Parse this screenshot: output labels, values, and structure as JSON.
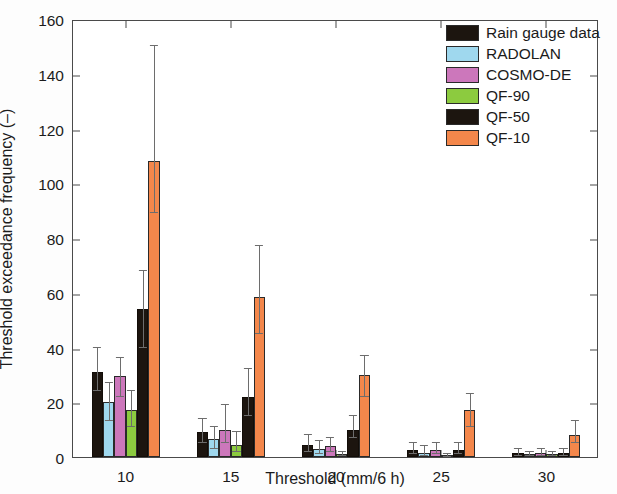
{
  "chart_data": {
    "type": "bar",
    "title": "",
    "xlabel": "Threshold (mm/6 h)",
    "ylabel": "Threshold exceedance frequency (–)",
    "categories": [
      "10",
      "15",
      "20",
      "25",
      "30"
    ],
    "xlim": [
      7.5,
      32.5
    ],
    "ylim": [
      0,
      160
    ],
    "ytick_labels": [
      "0",
      "20",
      "40",
      "60",
      "80",
      "100",
      "120",
      "140",
      "160"
    ],
    "ytick_values": [
      0,
      20,
      40,
      60,
      80,
      100,
      120,
      140,
      160
    ],
    "xtick_labels": [
      "10",
      "15",
      "20",
      "25",
      "30"
    ],
    "xtick_values": [
      10,
      15,
      20,
      25,
      30
    ],
    "grid": false,
    "legend_position": "top-right",
    "errorbars": true,
    "series": [
      {
        "name": "Rain gauge data",
        "color": "#1c150f",
        "values": [
          31,
          9,
          4.5,
          2.5,
          1.5
        ],
        "err_low": [
          24,
          5,
          2,
          1,
          0.5
        ],
        "err_high": [
          40,
          14,
          8,
          5,
          3
        ]
      },
      {
        "name": "RADOLAN",
        "color": "#9fd8ee",
        "values": [
          20,
          6.5,
          3,
          1.5,
          1
        ],
        "err_low": [
          13,
          3,
          1,
          0.3,
          0.2
        ],
        "err_high": [
          27,
          11,
          6,
          4,
          2
        ]
      },
      {
        "name": "COSMO-DE",
        "color": "#cc77bb",
        "values": [
          29.5,
          10,
          4,
          2.5,
          1.5
        ],
        "err_low": [
          22,
          5,
          2,
          1,
          0.5
        ],
        "err_high": [
          36,
          19,
          7,
          5,
          3
        ]
      },
      {
        "name": "QF-90",
        "color": "#8ccb3f",
        "values": [
          17,
          4.5,
          1,
          0.5,
          1
        ],
        "err_low": [
          11,
          2,
          0.2,
          0.1,
          0.2
        ],
        "err_high": [
          24,
          9,
          2,
          1,
          2
        ]
      },
      {
        "name": "QF-50",
        "color": "#1c150f",
        "values": [
          54,
          22,
          10,
          2.5,
          1.5
        ],
        "err_low": [
          40,
          15,
          7,
          1,
          0.5
        ],
        "err_high": [
          68,
          32,
          15,
          5,
          3
        ]
      },
      {
        "name": "QF-10",
        "color": "#f4874b",
        "values": [
          108,
          58.5,
          30,
          17,
          8
        ],
        "err_low": [
          89,
          45,
          22,
          11,
          5
        ],
        "err_high": [
          150,
          77,
          37,
          23,
          13
        ]
      }
    ]
  },
  "legend": {
    "items": [
      {
        "label": "Rain gauge data",
        "color": "#1c150f"
      },
      {
        "label": "RADOLAN",
        "color": "#9fd8ee"
      },
      {
        "label": "COSMO-DE",
        "color": "#cc77bb"
      },
      {
        "label": "QF-90",
        "color": "#8ccb3f"
      },
      {
        "label": "QF-50",
        "color": "#1c150f"
      },
      {
        "label": "QF-10",
        "color": "#f4874b"
      }
    ]
  }
}
